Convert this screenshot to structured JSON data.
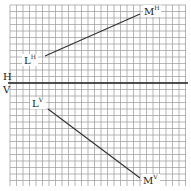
{
  "diagram": {
    "type": "orthographic-projection-line",
    "grid": {
      "x0": 10,
      "y0": 5,
      "x1": 186,
      "y1": 186,
      "spacing": 6.5,
      "color": "#9a9a9a"
    },
    "reference_line": {
      "y": 83,
      "x0": 8,
      "x1": 188,
      "upper_label": "H",
      "lower_label": "V",
      "color": "#222222"
    },
    "horizontal_projection": {
      "start": {
        "name": "L",
        "superscript": "H",
        "x": 45,
        "y": 56
      },
      "end": {
        "name": "M",
        "superscript": "H",
        "x": 140,
        "y": 14
      }
    },
    "vertical_projection": {
      "start": {
        "name": "L",
        "superscript": "V",
        "x": 48,
        "y": 109
      },
      "end": {
        "name": "M",
        "superscript": "V",
        "x": 140,
        "y": 178
      }
    },
    "line_color": "#333333"
  }
}
